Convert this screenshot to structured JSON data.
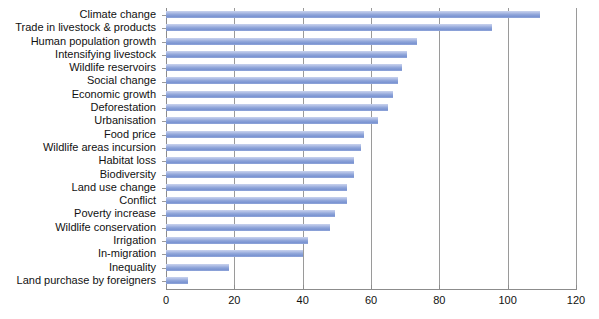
{
  "chart_data": {
    "type": "bar",
    "orientation": "horizontal",
    "title": "",
    "subtitle": "",
    "xlabel": "",
    "ylabel": "",
    "xlim": [
      0,
      120
    ],
    "xticks": [
      0,
      20,
      40,
      60,
      80,
      100,
      120
    ],
    "grid": "vertical",
    "legend": "none",
    "bar_color": "#8ba2d8",
    "categories": [
      "Climate change",
      "Trade in livestock & products",
      "Human population growth",
      "Intensifying livestock",
      "Wildlife reservoirs",
      "Social change",
      "Economic growth",
      "Deforestation",
      "Urbanisation",
      "Food price",
      "Wildlife areas incursion",
      "Habitat loss",
      "Biodiversity",
      "Land use change",
      "Conflict",
      "Poverty increase",
      "Wildlife conservation",
      "Irrigation",
      "In-migration",
      "Inequality",
      "Land purchase by foreigners"
    ],
    "values": [
      109.5,
      95.5,
      73.5,
      70.5,
      69,
      68,
      66.5,
      65,
      62,
      58,
      57,
      55,
      55,
      53,
      53,
      49.5,
      48,
      41.5,
      40,
      18.5,
      6.5
    ]
  }
}
